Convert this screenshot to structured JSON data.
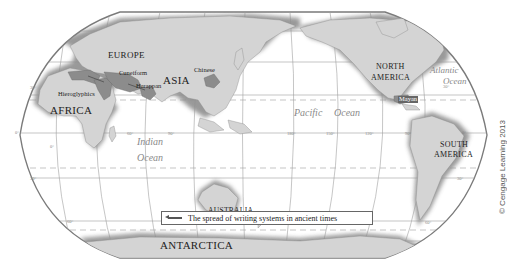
{
  "map": {
    "title": "The spread of writing systems in ancient times",
    "projection": "Robinson-style world map, Pacific-centered",
    "continents": [
      {
        "name": "EUROPE",
        "x": 108,
        "y": 54
      },
      {
        "name": "ASIA",
        "x": 164,
        "y": 79
      },
      {
        "name": "AFRICA",
        "x": 50,
        "y": 107
      },
      {
        "name": "AUSTRALIA",
        "x": 208,
        "y": 211
      },
      {
        "name": "NORTH",
        "x": 375,
        "y": 67
      },
      {
        "name": "AMERICA",
        "x": 371,
        "y": 78
      },
      {
        "name": "SOUTH",
        "x": 440,
        "y": 145
      },
      {
        "name": "AMERICA",
        "x": 435,
        "y": 155
      },
      {
        "name": "ANTARCTICA",
        "x": 160,
        "y": 244
      }
    ],
    "writing_systems": [
      {
        "name": "Hieroglyphics",
        "x": 58,
        "y": 94
      },
      {
        "name": "Cuneiform",
        "x": 120,
        "y": 72
      },
      {
        "name": "Harappan",
        "x": 136,
        "y": 84
      },
      {
        "name": "Chinese",
        "x": 195,
        "y": 69
      },
      {
        "name": "Mayan",
        "x": 398,
        "y": 98
      }
    ],
    "oceans": [
      {
        "name": "Indian",
        "x": 137,
        "y": 141
      },
      {
        "name": "Ocean",
        "x": 137,
        "y": 157
      },
      {
        "name": "Pacific",
        "x": 296,
        "y": 113
      },
      {
        "name": "Ocean",
        "x": 334,
        "y": 113
      },
      {
        "name": "Atlantic",
        "x": 431,
        "y": 68
      },
      {
        "name": "Ocean",
        "x": 443,
        "y": 80
      }
    ],
    "degree_labels": [
      "60°",
      "30°",
      "0°",
      "30°",
      "60°",
      "60°",
      "90°",
      "180°",
      "150°",
      "120°",
      "90°",
      "30°",
      "0°",
      "30°",
      "60°"
    ]
  },
  "legend": {
    "text": "The spread of writing systems in ancient times",
    "symbol": "arrow-icon"
  },
  "copyright": "© Cengage Learning 2013",
  "colors": {
    "land": "#d2d2d2",
    "land_shadow": "#9a9a9a",
    "highlight_region": "#8c8c8c",
    "ocean": "#ffffff",
    "graticule": "#9a9a9a",
    "border": "#888888"
  }
}
